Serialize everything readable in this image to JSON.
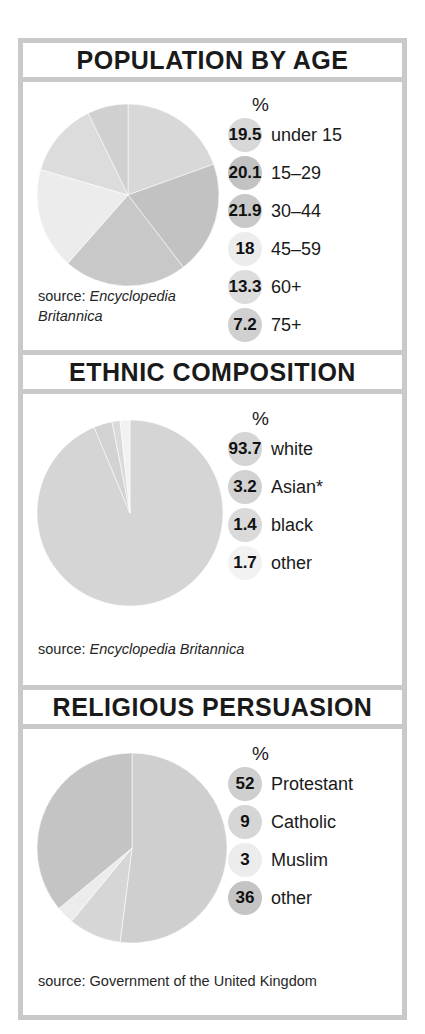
{
  "panels": [
    {
      "title": "POPULATION BY AGE",
      "pct_header": "%",
      "source_prefix": "source:",
      "source_name": "Encyclopedia Britannica",
      "source_italic": true,
      "entries": [
        {
          "value": "19.5",
          "label": "under 15",
          "color": "#d8d8d8"
        },
        {
          "value": "20.1",
          "label": "15–29",
          "color": "#c2c2c2"
        },
        {
          "value": "21.9",
          "label": "30–44",
          "color": "#c8c8c8"
        },
        {
          "value": "18",
          "label": "45–59",
          "color": "#ececec"
        },
        {
          "value": "13.3",
          "label": "60+",
          "color": "#dcdcdc"
        },
        {
          "value": "7.2",
          "label": "75+",
          "color": "#d0d0d0"
        }
      ]
    },
    {
      "title": "ETHNIC COMPOSITION",
      "pct_header": "%",
      "source_prefix": "source:",
      "source_name": "Encyclopedia Britannica",
      "source_italic": true,
      "entries": [
        {
          "value": "93.7",
          "label": "white",
          "color": "#d5d5d5"
        },
        {
          "value": "3.2",
          "label": "Asian*",
          "color": "#d2d2d2"
        },
        {
          "value": "1.4",
          "label": "black",
          "color": "#dadada"
        },
        {
          "value": "1.7",
          "label": "other",
          "color": "#f2f2f2"
        }
      ]
    },
    {
      "title": "RELIGIOUS PERSUASION",
      "pct_header": "%",
      "source_prefix": "source:",
      "source_name": "Government of the United Kingdom",
      "source_italic": false,
      "entries": [
        {
          "value": "52",
          "label": "Protestant",
          "color": "#cfcfcf"
        },
        {
          "value": "9",
          "label": "Catholic",
          "color": "#d6d6d6"
        },
        {
          "value": "3",
          "label": "Muslim",
          "color": "#ececec"
        },
        {
          "value": "36",
          "label": "other",
          "color": "#c4c4c4"
        }
      ]
    }
  ],
  "chart_data": [
    {
      "type": "pie",
      "title": "POPULATION BY AGE",
      "unit": "%",
      "categories": [
        "under 15",
        "15–29",
        "30–44",
        "45–59",
        "60+",
        "75+"
      ],
      "values": [
        19.5,
        20.1,
        21.9,
        18,
        13.3,
        7.2
      ],
      "colors": [
        "#d8d8d8",
        "#c2c2c2",
        "#c8c8c8",
        "#ececec",
        "#dcdcdc",
        "#d0d0d0"
      ],
      "start_angle": 0,
      "direction": "clockwise",
      "legend": "right",
      "source": "source: Encyclopedia Britannica"
    },
    {
      "type": "pie",
      "title": "ETHNIC COMPOSITION",
      "unit": "%",
      "categories": [
        "white",
        "Asian*",
        "black",
        "other"
      ],
      "values": [
        93.7,
        3.2,
        1.4,
        1.7
      ],
      "colors": [
        "#d5d5d5",
        "#d2d2d2",
        "#dadada",
        "#f2f2f2"
      ],
      "start_angle": 0,
      "direction": "clockwise",
      "legend": "right",
      "source": "source: Encyclopedia Britannica",
      "footnote_marker": "*"
    },
    {
      "type": "pie",
      "title": "RELIGIOUS PERSUASION",
      "unit": "%",
      "categories": [
        "Protestant",
        "Catholic",
        "Muslim",
        "other"
      ],
      "values": [
        52,
        9,
        3,
        36
      ],
      "colors": [
        "#cfcfcf",
        "#d6d6d6",
        "#ececec",
        "#c4c4c4"
      ],
      "start_angle": 0,
      "direction": "clockwise",
      "legend": "right",
      "source": "source: Government of the United Kingdom"
    }
  ]
}
